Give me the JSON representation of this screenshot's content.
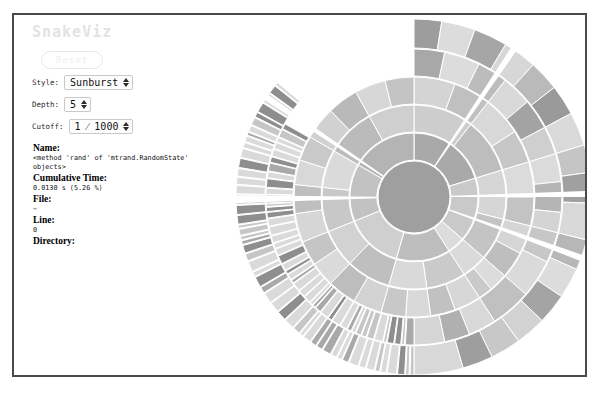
{
  "header": {
    "title": "SnakeViz"
  },
  "controls": {
    "reset_label": "Reset",
    "style": {
      "label": "Style:",
      "value": "Sunburst",
      "options": [
        "Sunburst",
        "Icicle"
      ]
    },
    "depth": {
      "label": "Depth:",
      "value": "5"
    },
    "cutoff": {
      "label": "Cutoff:",
      "value": "1 ⁄ 1000"
    }
  },
  "info": {
    "name": {
      "key": "Name:",
      "value": "<method 'rand' of 'mtrand.RandomState' objects>"
    },
    "cumulative_time": {
      "key": "Cumulative Time:",
      "value": "0.0130 s (5.26 %)"
    },
    "file": {
      "key": "File:",
      "value": "~"
    },
    "line": {
      "key": "Line:",
      "value": "0"
    },
    "directory": {
      "key": "Directory:",
      "value": ""
    }
  },
  "chart_data": {
    "type": "pie",
    "title": "",
    "variant": "sunburst",
    "legend": "none",
    "grid": false,
    "center": {
      "x": 200,
      "y": 182
    },
    "inner_radius": 36,
    "outer_radius": 178,
    "ring_count": 6,
    "ring_gap": 1.5,
    "stroke_color": "#ffffff",
    "background": "#ffffff",
    "palette": [
      "#dedede",
      "#d3d3d3",
      "#c6c6c6",
      "#bcbcbc",
      "#b2b2b2",
      "#a6a6a6",
      "#9a9a9a",
      "#8f8f8f",
      "#cbcbcb",
      "#d8d8d8"
    ],
    "root_color": "#9f9f9f",
    "angle_origin_deg": -90,
    "rings": [
      {
        "level": 0,
        "r_inner": 0,
        "r_outer": 36,
        "segments": [
          {
            "start": 0,
            "end": 360,
            "color": "#9f9f9f"
          }
        ]
      },
      {
        "level": 1,
        "r_inner": 37,
        "r_outer": 64,
        "segments": [
          {
            "start": 0,
            "end": 73.0,
            "color": "#a9a9a9"
          },
          {
            "start": 73.0,
            "end": 131.0,
            "color": "#c9c9c9"
          },
          {
            "start": 131.0,
            "end": 147.0,
            "color": "#dcdcdc"
          },
          {
            "start": 147.0,
            "end": 196.0,
            "color": "#bdbdbd"
          },
          {
            "start": 196.0,
            "end": 248.0,
            "color": "#cfcfcf"
          },
          {
            "start": 248.0,
            "end": 300.0,
            "color": "#c2c2c2"
          },
          {
            "start": 300.0,
            "end": 360.0,
            "color": "#b4b4b4"
          }
        ]
      },
      {
        "level": 2,
        "r_inner": 65,
        "r_outer": 92,
        "segments": [
          {
            "start": 0,
            "end": 38.0,
            "color": "#cdcdcd"
          },
          {
            "start": 38.0,
            "end": 73.0,
            "color": "#bdbdbd"
          },
          {
            "start": 73.0,
            "end": 104.0,
            "color": "#d6d6d6"
          },
          {
            "start": 104.0,
            "end": 131.0,
            "color": "#c4c4c4"
          },
          {
            "start": 131.0,
            "end": 147.0,
            "color": "#dadada"
          },
          {
            "start": 147.0,
            "end": 172.0,
            "color": "#cacaca"
          },
          {
            "start": 172.0,
            "end": 196.0,
            "color": "#d9d9d9"
          },
          {
            "start": 196.0,
            "end": 224.0,
            "color": "#bfbfbf"
          },
          {
            "start": 224.0,
            "end": 248.0,
            "color": "#d2d2d2"
          },
          {
            "start": 248.0,
            "end": 276.0,
            "color": "#c8c8c8"
          },
          {
            "start": 276.0,
            "end": 300.0,
            "color": "#dadada"
          },
          {
            "start": 300.0,
            "end": 331.0,
            "color": "#bbbbbb"
          },
          {
            "start": 331.0,
            "end": 360.0,
            "color": "#cfcfcf"
          }
        ]
      },
      {
        "level": 3,
        "r_inner": 93,
        "r_outer": 120,
        "segments": [
          {
            "start": 0,
            "end": 20.0,
            "color": "#d4d4d4"
          },
          {
            "start": 20.0,
            "end": 38.0,
            "color": "#c0c0c0"
          },
          {
            "start": 38.0,
            "end": 57.0,
            "color": "#d8d8d8"
          },
          {
            "start": 57.0,
            "end": 73.0,
            "color": "#c6c6c6"
          },
          {
            "start": 73.0,
            "end": 90.0,
            "color": "#dbdbdb"
          },
          {
            "start": 90.0,
            "end": 104.0,
            "color": "#c3c3c3"
          },
          {
            "start": 104.0,
            "end": 118.0,
            "color": "#d5d5d5"
          },
          {
            "start": 118.0,
            "end": 131.0,
            "color": "#bebebe"
          },
          {
            "start": 131.0,
            "end": 140.0,
            "color": "#dcdcdc"
          },
          {
            "start": 140.0,
            "end": 147.0,
            "color": "#cacaca"
          },
          {
            "start": 147.0,
            "end": 160.0,
            "color": "#d7d7d7"
          },
          {
            "start": 160.0,
            "end": 172.0,
            "color": "#c1c1c1"
          },
          {
            "start": 172.0,
            "end": 184.0,
            "color": "#d9d9d9"
          },
          {
            "start": 184.0,
            "end": 196.0,
            "color": "#c8c8c8"
          },
          {
            "start": 196.0,
            "end": 210.0,
            "color": "#d3d3d3"
          },
          {
            "start": 210.0,
            "end": 224.0,
            "color": "#bdbdbd"
          },
          {
            "start": 224.0,
            "end": 236.0,
            "color": "#dadada"
          },
          {
            "start": 236.0,
            "end": 248.0,
            "color": "#c5c5c5"
          },
          {
            "start": 248.0,
            "end": 262.0,
            "color": "#d6d6d6"
          },
          {
            "start": 262.0,
            "end": 276.0,
            "color": "#bfbfbf"
          },
          {
            "start": 276.0,
            "end": 288.0,
            "color": "#d8d8d8"
          },
          {
            "start": 288.0,
            "end": 300.0,
            "color": "#c9c9c9"
          },
          {
            "start": 300.0,
            "end": 316.0,
            "color": "#d1d1d1"
          },
          {
            "start": 316.0,
            "end": 331.0,
            "color": "#b9b9b9"
          },
          {
            "start": 331.0,
            "end": 346.0,
            "color": "#d7d7d7"
          },
          {
            "start": 346.0,
            "end": 360.0,
            "color": "#c4c4c4"
          }
        ]
      },
      {
        "level": 4,
        "r_inner": 121,
        "r_outer": 148,
        "dense_from": 180,
        "dense_to": 300,
        "segments": [
          {
            "start": 0,
            "end": 12.0,
            "color": "#a8a8a8"
          },
          {
            "start": 12.0,
            "end": 26.0,
            "color": "#dcdcdc"
          },
          {
            "start": 26.0,
            "end": 38.0,
            "color": "#bcbcbc"
          },
          {
            "start": 38.0,
            "end": 50.0,
            "color": "#d9d9d9"
          },
          {
            "start": 50.0,
            "end": 62.0,
            "color": "#a3a3a3"
          },
          {
            "start": 62.0,
            "end": 73.0,
            "color": "#cfcfcf"
          },
          {
            "start": 73.0,
            "end": 84.0,
            "color": "#dbdbdb"
          },
          {
            "start": 84.0,
            "end": 96.0,
            "color": "#b5b5b5"
          },
          {
            "start": 96.0,
            "end": 104.0,
            "color": "#d4d4d4"
          },
          {
            "start": 104.0,
            "end": 116.0,
            "color": "#c7c7c7"
          },
          {
            "start": 116.0,
            "end": 131.0,
            "color": "#dadada"
          },
          {
            "start": 131.0,
            "end": 147.0,
            "color": "#c0c0c0"
          },
          {
            "start": 147.0,
            "end": 158.0,
            "color": "#d8d8d8"
          },
          {
            "start": 158.0,
            "end": 168.0,
            "color": "#b0b0b0"
          },
          {
            "start": 168.0,
            "end": 180.0,
            "color": "#d5d5d5"
          }
        ]
      },
      {
        "level": 5,
        "r_inner": 149,
        "r_outer": 178,
        "dense_from": 180,
        "dense_to": 310,
        "segments": [
          {
            "start": 0,
            "end": 9.0,
            "color": "#9d9d9d"
          },
          {
            "start": 9.0,
            "end": 20.0,
            "color": "#dcdcdc"
          },
          {
            "start": 20.0,
            "end": 31.0,
            "color": "#a6a6a6"
          },
          {
            "start": 31.0,
            "end": 42.0,
            "color": "#d7d7d7"
          },
          {
            "start": 42.0,
            "end": 52.0,
            "color": "#bababa"
          },
          {
            "start": 52.0,
            "end": 62.0,
            "color": "#9a9a9a"
          },
          {
            "start": 62.0,
            "end": 73.0,
            "color": "#dadada"
          },
          {
            "start": 73.0,
            "end": 82.0,
            "color": "#c5c5c5"
          },
          {
            "start": 82.0,
            "end": 92.0,
            "color": "#a0a0a0"
          },
          {
            "start": 92.0,
            "end": 104.0,
            "color": "#d9d9d9"
          },
          {
            "start": 104.0,
            "end": 114.0,
            "color": "#b7b7b7"
          },
          {
            "start": 114.0,
            "end": 124.0,
            "color": "#dcdcdc"
          },
          {
            "start": 124.0,
            "end": 134.0,
            "color": "#a4a4a4"
          },
          {
            "start": 134.0,
            "end": 144.0,
            "color": "#d2d2d2"
          },
          {
            "start": 144.0,
            "end": 154.0,
            "color": "#c8c8c8"
          },
          {
            "start": 154.0,
            "end": 164.0,
            "color": "#9e9e9e"
          },
          {
            "start": 164.0,
            "end": 180.0,
            "color": "#d8d8d8"
          }
        ]
      }
    ],
    "gaps": [
      {
        "start": 268.0,
        "end": 270.5
      },
      {
        "start": 303.0,
        "end": 305.0
      },
      {
        "start": 33.0,
        "end": 35.0
      },
      {
        "start": 88.0,
        "end": 90.0
      },
      {
        "start": 109.0,
        "end": 111.0
      }
    ]
  }
}
